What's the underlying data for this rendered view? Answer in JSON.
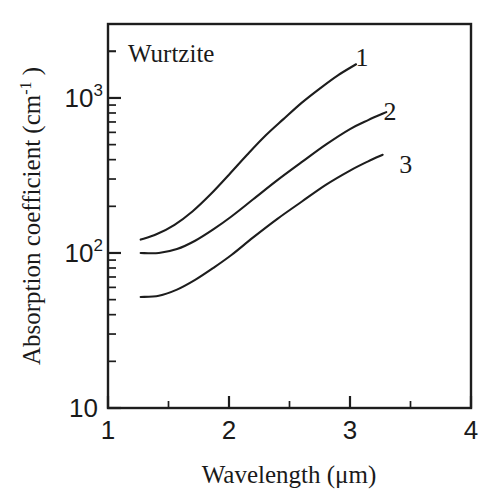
{
  "chart_data": {
    "type": "line",
    "title": "",
    "annotation": "Wurtzite",
    "xlabel": "Wavelength (μm)",
    "ylabel_main": "Absorption coefficient (cm",
    "ylabel_sup": "-1",
    "ylabel_tail": " )",
    "xlim": [
      1,
      4
    ],
    "ylim": [
      10,
      3000
    ],
    "xscale": "linear",
    "yscale": "log",
    "grid": false,
    "legend": "inline-end-labels",
    "xticks": [
      1,
      2,
      3,
      4
    ],
    "xtick_labels": [
      "1",
      "2",
      "3",
      "4"
    ],
    "xminor_ticks": [
      1.5,
      2.5,
      3.5
    ],
    "yticks": [
      10,
      100,
      1000
    ],
    "ytick_labels": [
      "10",
      "10",
      "10"
    ],
    "ytick_exponents": [
      "",
      "2",
      "3"
    ],
    "yminor_decades": [
      10,
      100,
      1000
    ],
    "series": [
      {
        "name": "1",
        "label": "1",
        "label_x": 3.1,
        "label_y": 1850,
        "x": [
          1.27,
          1.4,
          1.55,
          1.7,
          1.85,
          2.0,
          2.15,
          2.3,
          2.45,
          2.6,
          2.75,
          2.9,
          3.05
        ],
        "y": [
          122,
          132,
          152,
          186,
          240,
          320,
          430,
          570,
          730,
          930,
          1150,
          1400,
          1650
        ]
      },
      {
        "name": "2",
        "label": "2",
        "label_x": 3.33,
        "label_y": 820,
        "x": [
          1.27,
          1.42,
          1.57,
          1.72,
          1.87,
          2.02,
          2.2,
          2.4,
          2.6,
          2.8,
          3.0,
          3.15,
          3.3
        ],
        "y": [
          100,
          100,
          106,
          120,
          142,
          172,
          222,
          295,
          385,
          500,
          630,
          720,
          810
        ]
      },
      {
        "name": "3",
        "label": "3",
        "label_x": 3.46,
        "label_y": 375,
        "x": [
          1.27,
          1.42,
          1.57,
          1.72,
          1.87,
          2.02,
          2.2,
          2.4,
          2.6,
          2.8,
          3.0,
          3.15,
          3.27
        ],
        "y": [
          52,
          53,
          58,
          67,
          80,
          97,
          126,
          166,
          214,
          275,
          340,
          390,
          430
        ]
      }
    ],
    "colors": {
      "line": "#1d1d1d",
      "axis": "#1d1d1d",
      "background": "#ffffff"
    }
  }
}
